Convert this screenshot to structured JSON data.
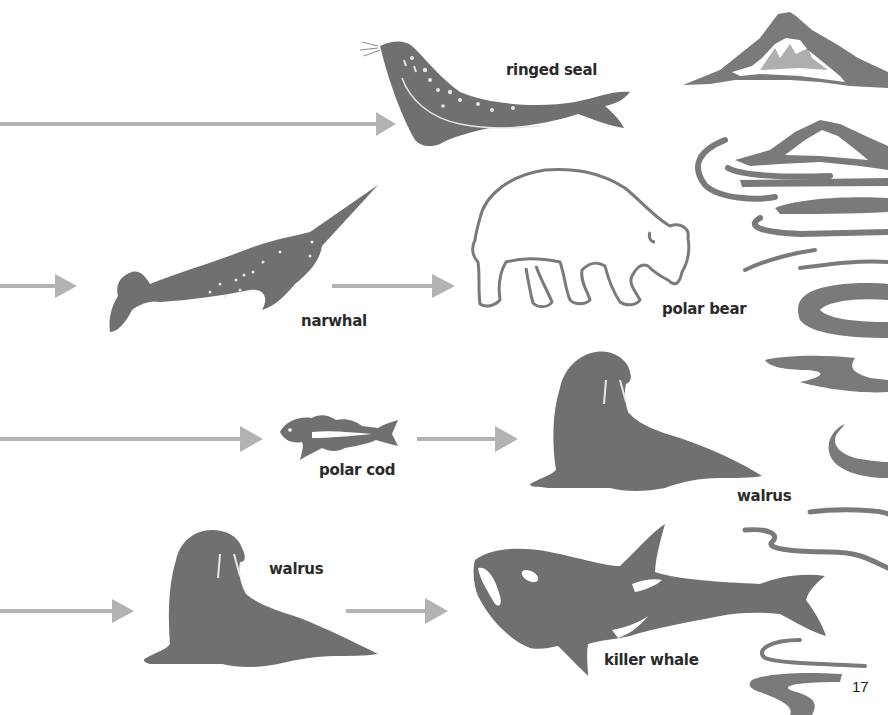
{
  "page": {
    "number": "17",
    "colors": {
      "background": "#ffffff",
      "animal": "#707070",
      "arrow": "#b3b3b3",
      "label": "#2a2a2a",
      "scenery": "#7a7a7a"
    }
  },
  "food_web": {
    "rows": [
      {
        "animals": [
          {
            "id": "ringed-seal",
            "label": "ringed seal"
          }
        ],
        "arrows": 1
      },
      {
        "animals": [
          {
            "id": "narwhal",
            "label": "narwhal"
          },
          {
            "id": "polar-bear",
            "label": "polar bear"
          }
        ],
        "arrows": 2
      },
      {
        "animals": [
          {
            "id": "polar-cod",
            "label": "polar cod"
          },
          {
            "id": "walrus-1",
            "label": "walrus"
          }
        ],
        "arrows": 2
      },
      {
        "animals": [
          {
            "id": "walrus-2",
            "label": "walrus"
          },
          {
            "id": "killer-whale",
            "label": "killer whale"
          }
        ],
        "arrows": 2
      }
    ]
  },
  "labels": {
    "ringed_seal": "ringed seal",
    "narwhal": "narwhal",
    "polar_bear": "polar bear",
    "polar_cod": "polar cod",
    "walrus_1": "walrus",
    "walrus_2": "walrus",
    "killer_whale": "killer whale"
  }
}
